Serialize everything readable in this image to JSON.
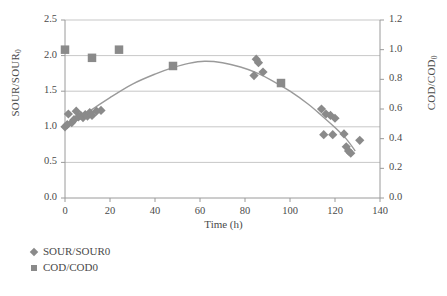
{
  "chart_data": {
    "type": "scatter",
    "title": "",
    "xlabel": "Time (h)",
    "ylabel_left": "SOUR/SOUR0",
    "ylabel_right": "COD/COD0",
    "ylabel_left_base": "SOUR/SOUR",
    "ylabel_left_sub": "0",
    "ylabel_right_base": "COD/COD",
    "ylabel_right_sub": "0",
    "xlim": [
      0,
      140
    ],
    "ylim_left": [
      0.0,
      2.5
    ],
    "ylim_right": [
      0.0,
      1.2
    ],
    "xticks": [
      "0",
      "20",
      "40",
      "60",
      "80",
      "100",
      "120",
      "140"
    ],
    "xtick_values": [
      0,
      20,
      40,
      60,
      80,
      100,
      120,
      140
    ],
    "yticks_left": [
      "0.0",
      "0.5",
      "1.0",
      "1.5",
      "2.0",
      "2.5"
    ],
    "ytick_left_values": [
      0.0,
      0.5,
      1.0,
      1.5,
      2.0,
      2.5
    ],
    "yticks_right": [
      "0.0",
      "0.2",
      "0.4",
      "0.6",
      "0.8",
      "1.0",
      "1.2"
    ],
    "ytick_right_values": [
      0.0,
      0.2,
      0.4,
      0.6,
      0.8,
      1.0,
      1.2
    ],
    "grid": "horizontal",
    "legend_position": "below-left",
    "marker_color": "#8a8a8a",
    "line_color": "#9a9a9a",
    "axis_color": "#9a9a9a",
    "series": [
      {
        "name": "SOUR/SOUR0",
        "marker": "diamond",
        "axis": "left",
        "points": [
          [
            0,
            1.0
          ],
          [
            1,
            1.03
          ],
          [
            1.5,
            1.18
          ],
          [
            3,
            1.06
          ],
          [
            4,
            1.1
          ],
          [
            5,
            1.22
          ],
          [
            6,
            1.14
          ],
          [
            7,
            1.16
          ],
          [
            8,
            1.13
          ],
          [
            9,
            1.17
          ],
          [
            10,
            1.15
          ],
          [
            11,
            1.2
          ],
          [
            12,
            1.16
          ],
          [
            14,
            1.22
          ],
          [
            16,
            1.23
          ],
          [
            84,
            1.72
          ],
          [
            85,
            1.95
          ],
          [
            86,
            1.9
          ],
          [
            88,
            1.77
          ],
          [
            114,
            1.25
          ],
          [
            116,
            1.18
          ],
          [
            118,
            1.16
          ],
          [
            120,
            1.12
          ],
          [
            115,
            0.89
          ],
          [
            119,
            0.89
          ],
          [
            124,
            0.9
          ],
          [
            125,
            0.72
          ],
          [
            126,
            0.66
          ],
          [
            127,
            0.63
          ],
          [
            131,
            0.81
          ]
        ]
      },
      {
        "name": "COD/COD0",
        "marker": "square",
        "axis": "right",
        "points": [
          [
            0,
            1.0
          ],
          [
            12,
            0.945
          ],
          [
            24,
            1.0
          ],
          [
            48,
            0.89
          ],
          [
            96,
            0.775
          ]
        ]
      }
    ],
    "trend_line": {
      "name": "fitted-curve",
      "axis": "left",
      "points": [
        [
          0,
          0.97
        ],
        [
          10,
          1.2
        ],
        [
          20,
          1.41
        ],
        [
          30,
          1.6
        ],
        [
          40,
          1.74
        ],
        [
          48,
          1.83
        ],
        [
          55,
          1.89
        ],
        [
          62,
          1.92
        ],
        [
          70,
          1.9
        ],
        [
          78,
          1.84
        ],
        [
          85,
          1.76
        ],
        [
          92,
          1.65
        ],
        [
          100,
          1.5
        ],
        [
          108,
          1.32
        ],
        [
          114,
          1.16
        ],
        [
          120,
          0.99
        ],
        [
          125,
          0.83
        ],
        [
          129,
          0.66
        ]
      ]
    }
  },
  "legend": {
    "items": [
      {
        "label": "SOUR/SOUR0",
        "marker": "diamond"
      },
      {
        "label": "COD/COD0",
        "marker": "square"
      }
    ]
  }
}
